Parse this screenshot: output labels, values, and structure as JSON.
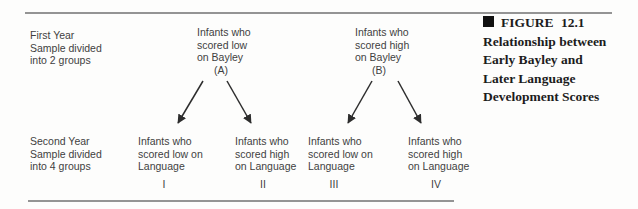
{
  "figure": {
    "caption": {
      "marker_icon": "black-square",
      "label": "FIGURE 12.1",
      "title_lines": [
        "Relationship between",
        "Early Bayley and",
        "Later Language",
        "Development Scores"
      ]
    },
    "left_labels": {
      "first_year": [
        "First Year",
        "Sample divided",
        "into 2 groups"
      ],
      "second_year": [
        "Second Year",
        "Sample divided",
        "into 4 groups"
      ]
    },
    "nodes": {
      "A": {
        "lines": [
          "Infants who",
          "scored low",
          "on Bayley"
        ],
        "tag": "(A)"
      },
      "B": {
        "lines": [
          "Infants who",
          "scored high",
          "on Bayley"
        ],
        "tag": "(B)"
      },
      "I": {
        "lines": [
          "Infants who",
          "scored low on",
          "Language"
        ],
        "tag": "I"
      },
      "II": {
        "lines": [
          "Infants who",
          "scored high",
          "on Language"
        ],
        "tag": "II"
      },
      "III": {
        "lines": [
          "Infants who",
          "scored low on",
          "Language"
        ],
        "tag": "III"
      },
      "IV": {
        "lines": [
          "Infants who",
          "scored high",
          "on Language"
        ],
        "tag": "IV"
      }
    },
    "edges": [
      {
        "from": "A",
        "to": "I"
      },
      {
        "from": "A",
        "to": "II"
      },
      {
        "from": "B",
        "to": "III"
      },
      {
        "from": "B",
        "to": "IV"
      }
    ],
    "colors": {
      "background": "#fdfdfc",
      "diagram_text": "#3f3f3f",
      "caption_text": "#1c1c1c",
      "rule": "#949494",
      "arrow": "#2d2d2d"
    }
  }
}
